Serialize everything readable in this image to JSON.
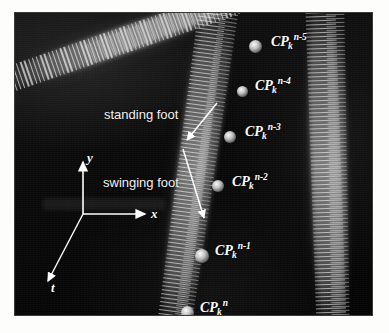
{
  "figure": {
    "kind": "footprint-trajectory-visualization",
    "background_color": "#070707",
    "page_background": "#fdfdfb",
    "marker_color": "#ffffff",
    "annotation_color": "#ffffff"
  },
  "annotations": {
    "standing_foot": "standing foot",
    "swinging_foot": "swinging foot"
  },
  "axes": {
    "x": "x",
    "y": "y",
    "t": "t"
  },
  "contact_points": [
    {
      "base": "CP",
      "sub": "k",
      "sup": "n-5",
      "dot_x": 240,
      "dot_y": 33,
      "label_x": 256,
      "label_y": 22
    },
    {
      "base": "CP",
      "sub": "k",
      "sup": "n-4",
      "dot_x": 227,
      "dot_y": 78,
      "label_x": 240,
      "label_y": 66
    },
    {
      "base": "CP",
      "sub": "k",
      "sup": "n-3",
      "dot_x": 215,
      "dot_y": 124,
      "label_x": 230,
      "label_y": 112
    },
    {
      "base": "CP",
      "sub": "k",
      "sup": "n-2",
      "dot_x": 203,
      "dot_y": 173,
      "label_x": 217,
      "label_y": 162
    },
    {
      "base": "CP",
      "sub": "k",
      "sup": "n-1",
      "dot_x": 187,
      "dot_y": 243,
      "label_x": 200,
      "label_y": 231
    },
    {
      "base": "CP",
      "sub": "k",
      "sup": "n",
      "dot_x": 172,
      "dot_y": 299,
      "label_x": 185,
      "label_y": 288
    }
  ]
}
